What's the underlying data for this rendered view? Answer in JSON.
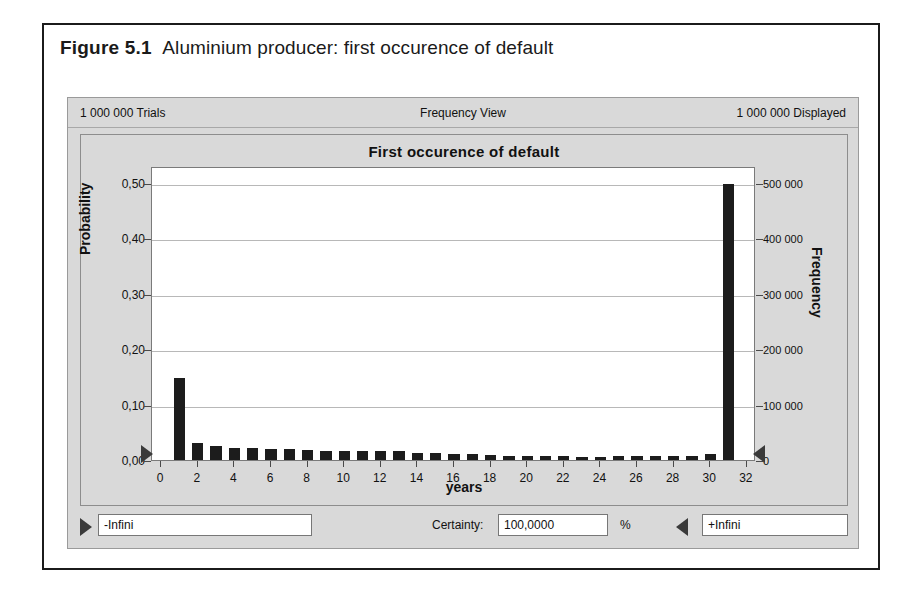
{
  "figure": {
    "number": "Figure 5.1",
    "caption": "Aluminium producer: first occurence of default"
  },
  "panel": {
    "header": {
      "trials": "1 000 000 Trials",
      "view": "Frequency View",
      "displayed": "1 000 000 Displayed"
    },
    "footer": {
      "min_value": "-Infini",
      "certainty_label": "Certainty:",
      "certainty_value": "100,0000",
      "percent_symbol": "%",
      "max_value": "+Infini",
      "left_grabber_icon": "triangle-right-icon",
      "right_grabber_icon": "triangle-left-icon"
    }
  },
  "chart_data": {
    "type": "bar",
    "title": "First occurence of default",
    "xlabel": "years",
    "ylabel": "Probability",
    "y2label": "Frequency",
    "grid": true,
    "legend": "none",
    "xlim": [
      -0.5,
      32.5
    ],
    "ylim": [
      0,
      0.53
    ],
    "y2lim": [
      0,
      530000
    ],
    "xticks": [
      0,
      2,
      4,
      6,
      8,
      10,
      12,
      14,
      16,
      18,
      20,
      22,
      24,
      26,
      28,
      30,
      32
    ],
    "xticklabels": [
      "0",
      "2",
      "4",
      "6",
      "8",
      "10",
      "12",
      "14",
      "16",
      "18",
      "20",
      "22",
      "24",
      "26",
      "28",
      "30",
      "32"
    ],
    "yticks": [
      0.0,
      0.1,
      0.2,
      0.3,
      0.4,
      0.5
    ],
    "yticklabels": [
      "0,00",
      "0,10",
      "0,20",
      "0,30",
      "0,40",
      "0,50"
    ],
    "y2ticks": [
      0,
      100000,
      200000,
      300000,
      400000,
      500000
    ],
    "y2ticklabels": [
      "0",
      "100 000",
      "200 000",
      "300 000",
      "400 000",
      "500 000"
    ],
    "categories": [
      1,
      2,
      3,
      4,
      5,
      6,
      7,
      8,
      9,
      10,
      11,
      12,
      13,
      14,
      15,
      16,
      17,
      18,
      19,
      20,
      21,
      22,
      23,
      24,
      25,
      26,
      27,
      28,
      29,
      30,
      31
    ],
    "values": [
      0.147,
      0.031,
      0.026,
      0.022,
      0.021,
      0.02,
      0.019,
      0.018,
      0.017,
      0.017,
      0.017,
      0.017,
      0.016,
      0.013,
      0.012,
      0.011,
      0.01,
      0.009,
      0.008,
      0.008,
      0.007,
      0.007,
      0.006,
      0.006,
      0.007,
      0.007,
      0.007,
      0.008,
      0.008,
      0.01,
      0.498
    ],
    "frequencies": [
      147000,
      31000,
      26000,
      22000,
      21000,
      20000,
      19000,
      18000,
      17000,
      17000,
      17000,
      17000,
      16000,
      13000,
      12000,
      11000,
      10000,
      9000,
      8000,
      8000,
      7000,
      7000,
      6000,
      6000,
      7000,
      7000,
      7000,
      8000,
      8000,
      10000,
      498000
    ],
    "bar_color": "#1c1c1c",
    "plot_bg": "#ffffff",
    "panel_bg": "#d9d9d9"
  }
}
